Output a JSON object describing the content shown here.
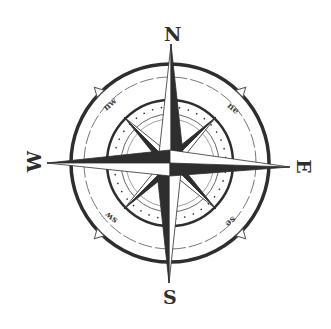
{
  "compass": {
    "labels": {
      "north": "N",
      "south": "S",
      "east": "E",
      "west": "W",
      "northwest": "nw",
      "northeast": "ne",
      "southwest": "sw",
      "southeast": "se"
    },
    "colors": {
      "ink": "#2e2e2e",
      "background": "#ffffff",
      "light_fill": "#f4f4f4"
    }
  }
}
